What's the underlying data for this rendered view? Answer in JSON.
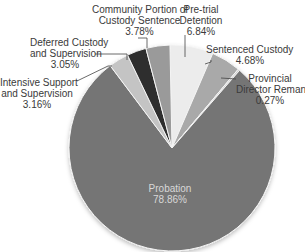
{
  "chart_data": {
    "type": "pie",
    "title": "",
    "slices": [
      {
        "label": "Pre-trial Detention",
        "value": 6.84,
        "display": "6.84%",
        "color": "#ececec"
      },
      {
        "label": "Sentenced Custody",
        "value": 4.68,
        "display": "4.68%",
        "color": "#a9a9a9"
      },
      {
        "label": "Provincial Director Remand*",
        "value": 0.27,
        "display": "0.27%",
        "color": "#d0d0d0"
      },
      {
        "label": "Probation",
        "value": 78.86,
        "display": "78.86%",
        "color": "#757575"
      },
      {
        "label": "Intensive Support and Supervision",
        "value": 3.16,
        "display": "3.16%",
        "color": "#c4c4c4"
      },
      {
        "label": "Deferred Custody and Supervision",
        "value": 3.05,
        "display": "3.05%",
        "color": "#2e2e2e"
      },
      {
        "label": "Community Portion of Custody Sentence",
        "value": 3.78,
        "display": "3.78%",
        "color": "#9a9a9a"
      }
    ],
    "legend": "none (callout labels)"
  },
  "labels": {
    "community_1": "Community Portion of",
    "community_2": "Custody Sentence",
    "community_pct": "3.78%",
    "pretrial_1": "Pre-trial",
    "pretrial_2": "Detention",
    "pretrial_pct": "6.84%",
    "deferred_1": "Deferred Custody",
    "deferred_2": "and Supervision",
    "deferred_pct": "3.05%",
    "sentenced_1": "Sentenced Custody",
    "sentenced_pct": "4.68%",
    "provincial_1": "Provincial",
    "provincial_2": "Director Remand*",
    "provincial_pct": "0.27%",
    "intensive_1": "Intensive Support",
    "intensive_2": "and Supervision",
    "intensive_pct": "3.16%",
    "probation_1": "Probation",
    "probation_pct": "78.86%"
  }
}
